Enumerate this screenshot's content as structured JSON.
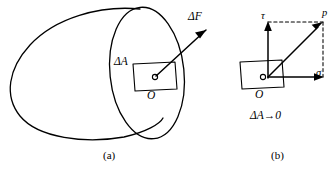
{
  "figure": {
    "background_color": "#ffffff",
    "stroke_color": "#000000",
    "panels": [
      {
        "id": "a",
        "caption": "(a)",
        "description": "Arbitrary solid body cut by a plane, showing elemental area ΔA at point O with resultant internal force ΔF",
        "labels": {
          "delta_force": "ΔF",
          "delta_area": "ΔA",
          "origin": "O"
        }
      },
      {
        "id": "b",
        "caption": "(b)",
        "description": "Resolution of total stress p at point O into normal stress σ and shear stress τ as ΔA tends to zero",
        "labels": {
          "shear_stress": "τ",
          "total_stress": "p",
          "normal_stress": "σ",
          "origin": "O",
          "limit": "ΔA→0"
        }
      }
    ]
  }
}
